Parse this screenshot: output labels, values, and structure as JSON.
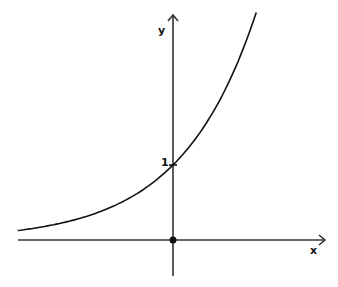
{
  "chart_data": {
    "type": "line",
    "title": "",
    "xlabel": "x",
    "ylabel": "y",
    "function": "y = e^x (exponential growth)",
    "annotations": [
      {
        "label": "1",
        "x": 0,
        "y": 1,
        "note": "y-intercept"
      },
      {
        "label": "",
        "x": 0,
        "y": 0,
        "note": "origin dot"
      }
    ],
    "x": [
      -2.07,
      -1.5,
      -1.0,
      -0.5,
      0,
      0.5,
      1.0,
      1.1
    ],
    "series": [
      {
        "name": "exponential curve",
        "values": [
          0.13,
          0.22,
          0.37,
          0.61,
          1.0,
          1.65,
          2.72,
          2.96
        ]
      }
    ],
    "xlim": [
      -2.07,
      2.03
    ],
    "ylim": [
      -0.6,
      3.0
    ],
    "grid": false,
    "legend": "none",
    "colors": {
      "axes": "#333333",
      "curve": "#111111"
    }
  },
  "labels": {
    "x_axis": "x",
    "y_axis": "y",
    "intercept": "1"
  }
}
